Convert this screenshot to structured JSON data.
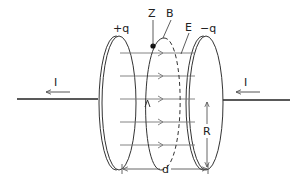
{
  "diagram": {
    "labels": {
      "left_plate_charge": "+q",
      "right_plate_charge": "−q",
      "point": "Z",
      "magnetic_loop": "B",
      "electric_field": "E",
      "current_left": "I",
      "current_right": "I",
      "radius": "R",
      "separation": "d"
    },
    "field_line_count": 5,
    "colors": {
      "stroke": "#333333",
      "field_lines": "#777777",
      "background": "#ffffff"
    }
  }
}
